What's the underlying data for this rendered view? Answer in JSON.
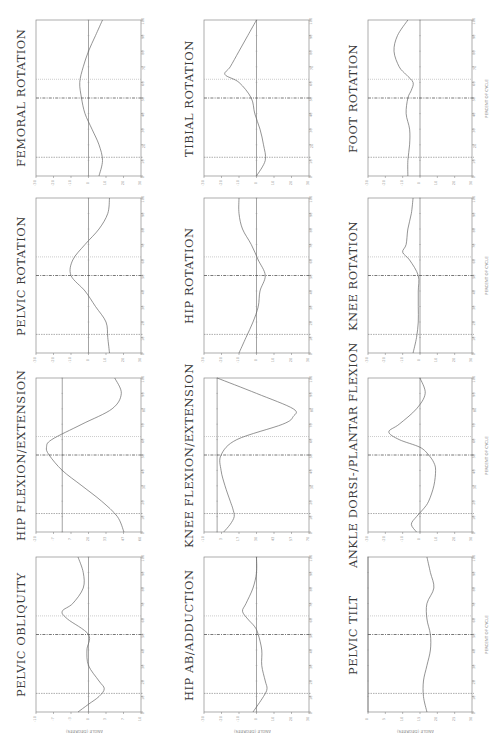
{
  "page": {
    "orientation": "rotated-90-ccw",
    "x_axis_label": "PERCENT OF CYCLE",
    "y_axis_label": "ANGLE (DEGREES)"
  },
  "chart_data": [
    {
      "id": "femoral-rotation",
      "type": "line",
      "title": "FEMORAL ROTATION",
      "xlabel": "PERCENT OF CYCLE",
      "ylabel": "ANGLE (DEGREES)",
      "xlim": [
        0,
        100
      ],
      "ylim": [
        -30,
        30
      ],
      "toe_off": 62,
      "opposite_foot": [
        12,
        50
      ],
      "x": [
        0,
        10,
        20,
        30,
        40,
        50,
        60,
        70,
        80,
        90,
        100
      ],
      "values": [
        6,
        8,
        6,
        2,
        -2,
        -4,
        -5,
        -3,
        0,
        4,
        8
      ],
      "col": 0,
      "row": 0
    },
    {
      "id": "pelvic-rotation",
      "type": "line",
      "title": "PELVIC ROTATION",
      "xlabel": "PERCENT OF CYCLE",
      "ylabel": "ANGLE (DEGREES)",
      "xlim": [
        0,
        100
      ],
      "ylim": [
        -30,
        30
      ],
      "toe_off": 62,
      "opposite_foot": [
        12,
        50
      ],
      "x": [
        0,
        10,
        20,
        30,
        40,
        50,
        60,
        70,
        80,
        90,
        100
      ],
      "values": [
        12,
        11,
        10,
        4,
        -2,
        -10,
        -9,
        -2,
        6,
        11,
        12
      ],
      "col": 1,
      "row": 0
    },
    {
      "id": "hip-flexion-extension",
      "type": "line",
      "title": "HIP FLEXION/EXTENSION",
      "xlabel": "PERCENT OF CYCLE",
      "ylabel": "ANGLE (DEGREES)",
      "xlim": [
        0,
        100
      ],
      "ylim": [
        -20,
        60
      ],
      "toe_off": 62,
      "opposite_foot": [
        12,
        50
      ],
      "x": [
        0,
        10,
        20,
        30,
        40,
        50,
        55,
        60,
        70,
        80,
        90,
        100
      ],
      "values": [
        47,
        42,
        30,
        15,
        0,
        -10,
        -12,
        -8,
        15,
        38,
        45,
        40
      ],
      "col": 2,
      "row": 0
    },
    {
      "id": "pelvic-obliquity",
      "type": "line",
      "title": "PELVIC OBLIQUITY",
      "xlabel": "PERCENT OF CYCLE",
      "ylabel": "ANGLE (DEGREES)",
      "xlim": [
        0,
        100
      ],
      "ylim": [
        -10,
        10
      ],
      "toe_off": 62,
      "opposite_foot": [
        12,
        50
      ],
      "x": [
        0,
        5,
        10,
        15,
        20,
        30,
        40,
        50,
        60,
        65,
        70,
        80,
        90,
        100
      ],
      "values": [
        -2,
        0,
        2,
        3,
        2,
        0,
        -0.3,
        0,
        -4,
        -5,
        -3,
        -1,
        -1,
        -2
      ],
      "col": 3,
      "row": 0
    },
    {
      "id": "tibial-rotation",
      "type": "line",
      "title": "TIBIAL ROTATION",
      "xlabel": "PERCENT OF CYCLE",
      "ylabel": "ANGLE (DEGREES)",
      "xlim": [
        0,
        100
      ],
      "ylim": [
        -30,
        30
      ],
      "toe_off": 62,
      "opposite_foot": [
        12,
        50
      ],
      "x": [
        0,
        10,
        20,
        30,
        40,
        50,
        60,
        65,
        70,
        80,
        90,
        100
      ],
      "values": [
        0,
        5,
        4,
        2,
        -1,
        -3,
        -10,
        -18,
        -15,
        -10,
        -5,
        0
      ],
      "col": 0,
      "row": 1
    },
    {
      "id": "hip-rotation",
      "type": "line",
      "title": "HIP ROTATION",
      "xlabel": "PERCENT OF CYCLE",
      "ylabel": "ANGLE (DEGREES)",
      "xlim": [
        0,
        100
      ],
      "ylim": [
        -30,
        30
      ],
      "toe_off": 62,
      "opposite_foot": [
        12,
        50
      ],
      "x": [
        0,
        10,
        20,
        30,
        40,
        50,
        60,
        70,
        80,
        90,
        100
      ],
      "values": [
        -10,
        -6,
        -2,
        1,
        2,
        5,
        1,
        -3,
        -8,
        -10,
        -10
      ],
      "col": 1,
      "row": 1
    },
    {
      "id": "knee-flexion-extension",
      "type": "line",
      "title": "KNEE FLEXION/EXTENSION",
      "xlabel": "PERCENT OF CYCLE",
      "ylabel": "ANGLE (DEGREES)",
      "xlim": [
        0,
        100
      ],
      "ylim": [
        -10,
        70
      ],
      "toe_off": 62,
      "opposite_foot": [
        12,
        50
      ],
      "x": [
        0,
        5,
        10,
        15,
        20,
        30,
        40,
        50,
        60,
        70,
        75,
        80,
        90,
        100
      ],
      "values": [
        5,
        10,
        13,
        12,
        10,
        6,
        3,
        3,
        15,
        50,
        58,
        58,
        30,
        0
      ],
      "col": 2,
      "row": 1
    },
    {
      "id": "hip-ab-adduction",
      "type": "line",
      "title": "HIP AB/ADDUCTION",
      "xlabel": "PERCENT OF CYCLE",
      "ylabel": "ANGLE (DEGREES)",
      "xlim": [
        0,
        100
      ],
      "ylim": [
        -30,
        30
      ],
      "toe_off": 62,
      "opposite_foot": [
        12,
        50
      ],
      "x": [
        0,
        10,
        15,
        20,
        30,
        40,
        50,
        55,
        60,
        65,
        70,
        80,
        90,
        100
      ],
      "values": [
        -2,
        4,
        6,
        5,
        3,
        3,
        1,
        -1,
        -5,
        -8,
        -6,
        -2,
        0,
        0
      ],
      "col": 3,
      "row": 1
    },
    {
      "id": "foot-rotation",
      "type": "line",
      "title": "FOOT ROTATION",
      "xlabel": "PERCENT OF CYCLE",
      "ylabel": "ANGLE (DEGREES)",
      "xlim": [
        0,
        100
      ],
      "ylim": [
        -30,
        30
      ],
      "toe_off": 62,
      "opposite_foot": [
        12,
        50
      ],
      "x": [
        0,
        10,
        20,
        30,
        40,
        50,
        55,
        60,
        65,
        70,
        80,
        90,
        100
      ],
      "values": [
        -7,
        -7,
        -6,
        -6,
        -8,
        -7,
        -5,
        -4,
        -8,
        -12,
        -15,
        -13,
        -7
      ],
      "col": 0,
      "row": 2
    },
    {
      "id": "knee-rotation",
      "type": "line",
      "title": "KNEE ROTATION",
      "xlabel": "PERCENT OF CYCLE",
      "ylabel": "ANGLE (DEGREES)",
      "xlim": [
        0,
        100
      ],
      "ylim": [
        -30,
        30
      ],
      "toe_off": 62,
      "opposite_foot": [
        12,
        50
      ],
      "x": [
        0,
        10,
        20,
        30,
        40,
        50,
        60,
        65,
        70,
        80,
        90,
        100
      ],
      "values": [
        -4,
        -2,
        -1,
        -1,
        -1,
        -1,
        -6,
        -10,
        -8,
        -7,
        -5,
        -4
      ],
      "col": 1,
      "row": 2
    },
    {
      "id": "ankle-dorsi-plantar-flexion",
      "type": "line",
      "title": "ANKLE DORSI-/PLANTAR FLEXION",
      "xlabel": "PERCENT OF CYCLE",
      "ylabel": "ANGLE (DEGREES)",
      "xlim": [
        0,
        100
      ],
      "ylim": [
        -30,
        30
      ],
      "toe_off": 62,
      "opposite_foot": [
        12,
        50
      ],
      "x": [
        0,
        5,
        10,
        15,
        20,
        30,
        40,
        45,
        50,
        55,
        60,
        65,
        70,
        80,
        90,
        100
      ],
      "values": [
        -2,
        -5,
        -2,
        2,
        5,
        8,
        9,
        8,
        5,
        0,
        -12,
        -18,
        -12,
        -2,
        3,
        0
      ],
      "col": 2,
      "row": 2
    },
    {
      "id": "pelvic-tilt",
      "type": "line",
      "title": "PELVIC TILT",
      "xlabel": "PERCENT OF CYCLE",
      "ylabel": "ANGLE (DEGREES)",
      "xlim": [
        0,
        100
      ],
      "ylim": [
        0,
        30
      ],
      "toe_off": 62,
      "opposite_foot": [
        12,
        50
      ],
      "x": [
        0,
        10,
        20,
        30,
        40,
        50,
        60,
        70,
        80,
        90,
        100
      ],
      "values": [
        17,
        16,
        16,
        17,
        18,
        18,
        17,
        17,
        19,
        18,
        17
      ],
      "col": 3,
      "row": 2
    }
  ]
}
